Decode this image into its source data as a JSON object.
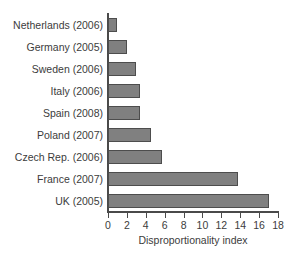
{
  "chart_data": {
    "type": "bar",
    "orientation": "horizontal",
    "title": "",
    "xlabel": "Disproportionality index",
    "ylabel": "",
    "xlim": [
      0,
      18
    ],
    "xticks": [
      0,
      2,
      4,
      6,
      8,
      10,
      12,
      14,
      16,
      18
    ],
    "grid": false,
    "legend": null,
    "bar_color": "#808080",
    "bar_edge_color": "#4d4d4d",
    "axis_color": "#4a4a4a",
    "text_color": "#3c3c3c",
    "categories": [
      "Netherlands (2006)",
      "Germany (2005)",
      "Sweden (2006)",
      "Italy (2006)",
      "Spain (2008)",
      "Poland (2007)",
      "Czech Rep. (2006)",
      "France (2007)",
      "UK (2005)"
    ],
    "values": [
      1.0,
      2.0,
      3.0,
      3.4,
      3.4,
      4.6,
      5.7,
      13.8,
      17.0
    ]
  }
}
